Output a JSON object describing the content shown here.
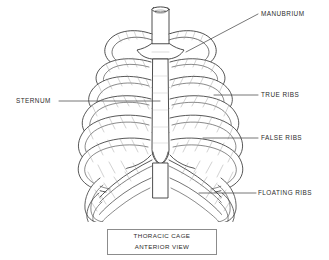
{
  "figure": {
    "title": "THORACIC CAGE ANTERIOR VIEW",
    "caption": {
      "line1": "THORACIC CAGE",
      "line2": "ANTERIOR VIEW"
    },
    "colors": {
      "background": "#ffffff",
      "outline": "#3a3a3a",
      "shading": "#9a9a9a",
      "leader_line": "#4a4a4a",
      "text": "#2b2b2b",
      "caption_border": "#8c8c8c"
    },
    "labels": [
      {
        "id": "manubrium",
        "text": "MANUBRIUM",
        "side": "right"
      },
      {
        "id": "true-ribs",
        "text": "TRUE RIBS",
        "side": "right"
      },
      {
        "id": "false-ribs",
        "text": "FALSE RIBS",
        "side": "right"
      },
      {
        "id": "floating-ribs",
        "text": "FLOATING RIBS",
        "side": "right"
      },
      {
        "id": "sternum",
        "text": "STERNUM",
        "side": "left"
      }
    ]
  }
}
